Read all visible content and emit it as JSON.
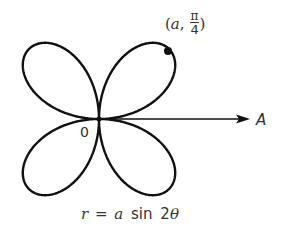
{
  "diagram": {
    "curve_equation": "r = a sin 2θ",
    "caption": {
      "r": "r",
      "eq": "=",
      "a": "a",
      "sin": "sin",
      "two": "2",
      "theta": "θ"
    },
    "origin_label": "0",
    "axis_label": "A",
    "point_label": {
      "open": "(",
      "a": "a",
      "comma": ",",
      "num": "π",
      "den": "4",
      "close": ")"
    },
    "colors": {
      "stroke": "#111111",
      "text": "#333333",
      "background": "#ffffff"
    }
  }
}
